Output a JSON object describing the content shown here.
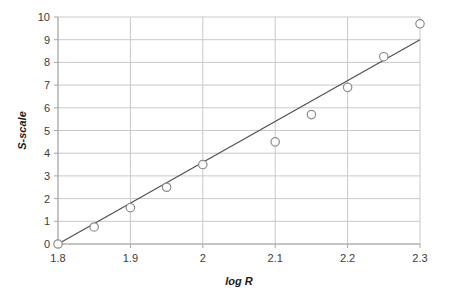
{
  "chart_data": {
    "type": "scatter",
    "title": "",
    "xlabel": "log R",
    "ylabel": "S-scale",
    "xlim": [
      1.8,
      2.3
    ],
    "ylim": [
      0,
      10
    ],
    "xticks": [
      "1.8",
      "1.9",
      "2",
      "2.1",
      "2.2",
      "2.3"
    ],
    "xtick_values": [
      1.8,
      1.9,
      2.0,
      2.1,
      2.2,
      2.3
    ],
    "yticks": [
      "0",
      "1",
      "2",
      "3",
      "4",
      "5",
      "6",
      "7",
      "8",
      "9",
      "10"
    ],
    "ytick_values": [
      0,
      1,
      2,
      3,
      4,
      5,
      6,
      7,
      8,
      9,
      10
    ],
    "grid": "horizontal-and-vertical",
    "legend": "none",
    "marker_style": "open-circle",
    "series": [
      {
        "name": "S-scale vs log R",
        "x": [
          1.8,
          1.85,
          1.9,
          1.95,
          2.0,
          2.1,
          2.15,
          2.2,
          2.25,
          2.3
        ],
        "y": [
          0.0,
          0.75,
          1.6,
          2.5,
          3.5,
          4.5,
          5.7,
          6.9,
          8.25,
          9.7
        ]
      }
    ],
    "trendline": {
      "type": "linear",
      "x_start": 1.8,
      "y_start": 0.0,
      "x_end": 2.3,
      "y_end": 9.0
    },
    "colors": {
      "grid": "#c9c9c9",
      "axis": "#a6a6a6",
      "trendline": "#4d4d4d",
      "marker_stroke": "#8c8c8c",
      "marker_fill": "#ffffff",
      "text": "#3b3b3b",
      "background": "#ffffff"
    }
  }
}
